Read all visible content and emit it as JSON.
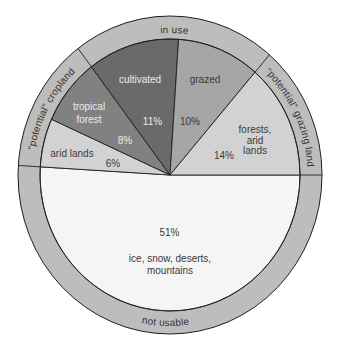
{
  "chart_data": {
    "type": "pie",
    "title": "",
    "xlabel": "",
    "ylabel": "",
    "unit": "%",
    "categories": [
      "ice, snow, deserts, mountains",
      "arid lands",
      "tropical forest",
      "cultivated",
      "grazed",
      "forests, arid lands"
    ],
    "values": [
      51,
      6,
      8,
      11,
      10,
      14
    ],
    "slices": [
      {
        "name": "ice, snow, deserts, mountains",
        "value": 51,
        "value_label": "51%",
        "label_lines": [
          "ice, snow, deserts,",
          "mountains"
        ],
        "group": "not usable",
        "color": "#f5f5f5",
        "text_color": "#3a3a3a"
      },
      {
        "name": "arid lands",
        "value": 6,
        "value_label": "6%",
        "label_lines": [
          "arid lands"
        ],
        "group": "“potential” cropland",
        "color": "#d2d2d2",
        "text_color": "#3a3a3a"
      },
      {
        "name": "tropical forest",
        "value": 8,
        "value_label": "8%",
        "label_lines": [
          "tropical",
          "forest"
        ],
        "group": "“potential” cropland",
        "color": "#818181",
        "text_color": "#ececec"
      },
      {
        "name": "cultivated",
        "value": 11,
        "value_label": "11%",
        "label_lines": [
          "cultivated"
        ],
        "group": "in use",
        "color": "#6a6a6a",
        "text_color": "#ececec"
      },
      {
        "name": "grazed",
        "value": 10,
        "value_label": "10%",
        "label_lines": [
          "grazed"
        ],
        "group": "in use",
        "color": "#a6a6a6",
        "text_color": "#3a3a3a"
      },
      {
        "name": "forests, arid lands",
        "value": 14,
        "value_label": "14%",
        "label_lines": [
          "forests,",
          "arid",
          "lands"
        ],
        "group": "“potential” grazing land",
        "color": "#d2d2d2",
        "text_color": "#3a3a3a"
      }
    ],
    "groups": [
      {
        "name": "not usable",
        "label": "not usable",
        "total": 51
      },
      {
        "name": "“potential” cropland",
        "label": "“potential” cropland",
        "total": 14
      },
      {
        "name": "in use",
        "label": "in use",
        "total": 21
      },
      {
        "name": "“potential” grazing land",
        "label": "“potential” grazing land",
        "total": 14
      }
    ],
    "start_angle_deg": 0,
    "direction": "clockwise",
    "legend": "none",
    "grid": false,
    "ring_color": "#bdbdbd",
    "line_color": "#1f1f1f"
  }
}
